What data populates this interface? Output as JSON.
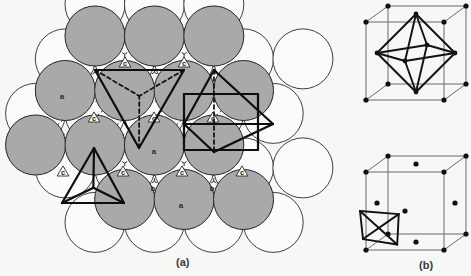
{
  "figure": {
    "background_color": "#f7f7f6"
  },
  "captions": {
    "left": "(a)",
    "right": "(b)"
  },
  "panel_a": {
    "name": "close-packed-sphere-layer-diagram",
    "sphere": {
      "radius": 30,
      "gray_fill": "#a9a9a9",
      "white_fill": "#fbfbfb",
      "outline_color": "#2a2a2a"
    },
    "layer_labels": [
      {
        "text": "a",
        "x": 62,
        "y": 99
      },
      {
        "text": "a",
        "x": 154,
        "y": 154
      },
      {
        "text": "a",
        "x": 181,
        "y": 208
      }
    ],
    "interstice_labels_c": [
      {
        "text": "c",
        "x": 125,
        "y": 63
      },
      {
        "text": "c",
        "x": 184,
        "y": 63
      },
      {
        "text": "c",
        "x": 94,
        "y": 118
      },
      {
        "text": "c",
        "x": 154,
        "y": 118
      },
      {
        "text": "c",
        "x": 213,
        "y": 118
      },
      {
        "text": "c",
        "x": 63,
        "y": 172
      },
      {
        "text": "c",
        "x": 123,
        "y": 172
      },
      {
        "text": "c",
        "x": 182,
        "y": 172
      },
      {
        "text": "c",
        "x": 242,
        "y": 172
      }
    ],
    "interstice_labels_b": [
      {
        "text": "b",
        "x": 153,
        "y": 191
      },
      {
        "text": "b",
        "x": 212,
        "y": 191
      }
    ],
    "overlays": [
      {
        "name": "tetrahedron-outline-top",
        "kind": "tetrahedron-down"
      },
      {
        "name": "octahedron-outline-right",
        "kind": "octahedron"
      },
      {
        "name": "tetrahedron-outline-bottom",
        "kind": "tetrahedron-up"
      }
    ]
  },
  "panel_b": {
    "name": "fcc-unit-cell-diagrams",
    "cells": [
      {
        "name": "fcc-cell-octahedral-site",
        "interstitial": "octahedron",
        "atom_count": 14
      },
      {
        "name": "fcc-cell-tetrahedral-site",
        "interstitial": "tetrahedron",
        "atom_count": 14
      }
    ],
    "atom_color": "#111111",
    "edge_color": "#6b6b6b",
    "polyhedron_color": "#111111"
  }
}
